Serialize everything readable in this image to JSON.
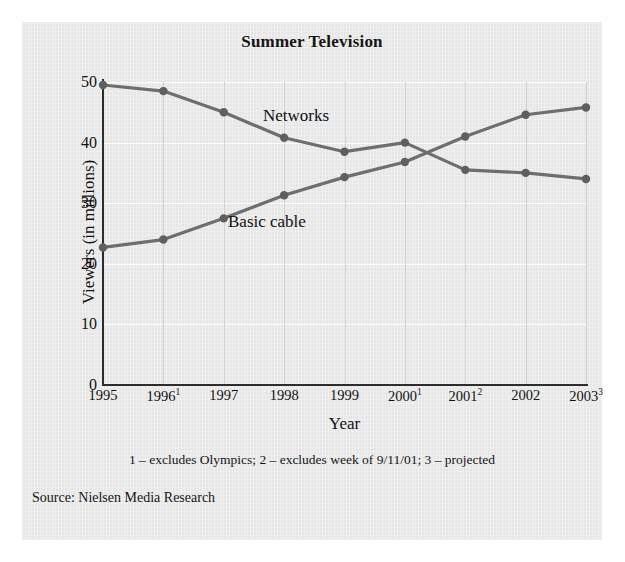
{
  "chart_data": {
    "type": "line",
    "title": "Summer Television",
    "xlabel": "Year",
    "ylabel": "Viewers (in millions)",
    "categories": [
      "1995",
      "1996",
      "1997",
      "1998",
      "1999",
      "2000",
      "2001",
      "2002",
      "2003"
    ],
    "category_labels": [
      {
        "text": "1995",
        "sup": ""
      },
      {
        "text": "1996",
        "sup": "1"
      },
      {
        "text": "1997",
        "sup": ""
      },
      {
        "text": "1998",
        "sup": ""
      },
      {
        "text": "1999",
        "sup": ""
      },
      {
        "text": "2000",
        "sup": "1"
      },
      {
        "text": "2001",
        "sup": "2"
      },
      {
        "text": "2002",
        "sup": ""
      },
      {
        "text": "2003",
        "sup": "3"
      }
    ],
    "ylim": [
      0,
      50
    ],
    "yticks": [
      0,
      10,
      20,
      30,
      40,
      50
    ],
    "xlim_labels": [
      "1995",
      "2003"
    ],
    "grid": "horizontal-and-vertical",
    "legend_position": "inline-annotations",
    "series": [
      {
        "name": "Networks",
        "values": [
          49.5,
          48.5,
          45.0,
          40.8,
          38.5,
          40.0,
          35.5,
          35.0,
          34.0
        ],
        "color": "#6e6e6e"
      },
      {
        "name": "Basic cable",
        "values": [
          22.7,
          24.0,
          27.5,
          31.3,
          34.3,
          36.8,
          41.0,
          44.6,
          45.8
        ],
        "color": "#6e6e6e"
      }
    ],
    "annotations": [
      {
        "name": "networks",
        "text": "Networks"
      },
      {
        "name": "basic-cable",
        "text": "Basic cable"
      }
    ],
    "footnote": "1 – excludes Olympics; 2 – excludes week of 9/11/01; 3 – projected",
    "source": "Source: Nielsen Media Research",
    "colors": {
      "line": "#6e6e6e",
      "marker": "#5f5f5f",
      "axis": "#2d2d2d",
      "gridline_horizontal": "#fdfdfd",
      "gridline_vertical": "#d2d2d2",
      "figure_background": "#ececec",
      "text": "#121212"
    }
  }
}
